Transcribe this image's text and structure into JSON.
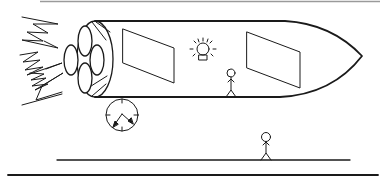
{
  "illustration": {
    "subject": "Rocket ship with passengers, clock, and person on ground",
    "colors": {
      "background": "#ffffff",
      "stroke": "#1a1a1a",
      "top_border": "#9a9a9a"
    },
    "elements": {
      "rocket": {
        "windows": 2,
        "engines": 4,
        "has_light_bulb": true,
        "passengers": 1
      },
      "exhaust_flames": {
        "count": 3
      },
      "clock": {
        "hands": 2
      },
      "ground_figure": {
        "count": 1
      },
      "lines": {
        "top_border": true,
        "ground_line": true,
        "bottom_line": true
      }
    }
  }
}
